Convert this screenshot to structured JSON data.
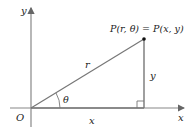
{
  "diagram": {
    "type": "polar-cartesian-relation",
    "labels": {
      "y_axis": "y",
      "x_axis": "x",
      "origin": "O",
      "point": "P(r, θ) = P(x, y)",
      "hypotenuse": "r",
      "vertical_leg": "y",
      "horizontal_leg": "x",
      "angle": "θ"
    },
    "colors": {
      "axis": "#888888",
      "line": "#777777",
      "point": "#111111",
      "text": "#222222"
    }
  }
}
